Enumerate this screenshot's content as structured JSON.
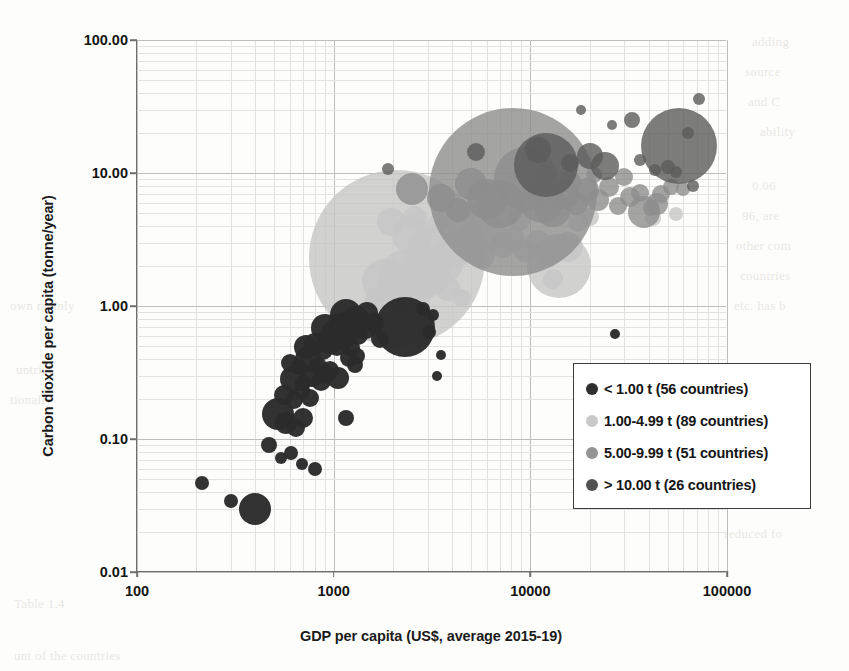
{
  "chart_data": {
    "type": "scatter",
    "title": "",
    "xlabel": "GDP per capita (US$, average 2015-19)",
    "ylabel": "Carbon dioxide per capita (tonne/year)",
    "xscale": "log",
    "yscale": "log",
    "xlim": [
      100,
      100000
    ],
    "ylim": [
      0.01,
      100.0
    ],
    "xticks": [
      "100",
      "1000",
      "10000",
      "100000"
    ],
    "xtick_values": [
      100,
      1000,
      10000,
      100000
    ],
    "yticks": [
      "100.00",
      "10.00",
      "1.00",
      "0.10",
      "0.01"
    ],
    "ytick_values": [
      100.0,
      10.0,
      1.0,
      0.1,
      0.01
    ],
    "grid": "major and minor log gridlines, light gray",
    "legend_position": "inside lower-right of plot area",
    "bubble_encoding": "bubble area ~ total national CO2 emissions; color = CO2 per-capita band",
    "series": [
      {
        "name": "< 1.00 t (56 countries)",
        "label": "< 1.00 t",
        "count": 56,
        "color": "#2b2b2b",
        "points": [
          {
            "x": 215,
            "y": 0.047,
            "r": 7
          },
          {
            "x": 300,
            "y": 0.034,
            "r": 7
          },
          {
            "x": 400,
            "y": 0.03,
            "r": 16
          },
          {
            "x": 470,
            "y": 0.09,
            "r": 8
          },
          {
            "x": 540,
            "y": 0.072,
            "r": 6
          },
          {
            "x": 610,
            "y": 0.078,
            "r": 7
          },
          {
            "x": 690,
            "y": 0.065,
            "r": 6
          },
          {
            "x": 800,
            "y": 0.06,
            "r": 7
          },
          {
            "x": 520,
            "y": 0.155,
            "r": 16
          },
          {
            "x": 575,
            "y": 0.132,
            "r": 11
          },
          {
            "x": 640,
            "y": 0.12,
            "r": 9
          },
          {
            "x": 700,
            "y": 0.145,
            "r": 10
          },
          {
            "x": 560,
            "y": 0.215,
            "r": 10
          },
          {
            "x": 630,
            "y": 0.195,
            "r": 9
          },
          {
            "x": 690,
            "y": 0.23,
            "r": 8
          },
          {
            "x": 760,
            "y": 0.205,
            "r": 9
          },
          {
            "x": 620,
            "y": 0.285,
            "r": 13
          },
          {
            "x": 700,
            "y": 0.265,
            "r": 8
          },
          {
            "x": 780,
            "y": 0.3,
            "r": 11
          },
          {
            "x": 860,
            "y": 0.275,
            "r": 10
          },
          {
            "x": 600,
            "y": 0.37,
            "r": 9
          },
          {
            "x": 670,
            "y": 0.345,
            "r": 8
          },
          {
            "x": 740,
            "y": 0.4,
            "r": 13
          },
          {
            "x": 830,
            "y": 0.355,
            "r": 9
          },
          {
            "x": 900,
            "y": 0.31,
            "r": 10
          },
          {
            "x": 960,
            "y": 0.33,
            "r": 9
          },
          {
            "x": 1050,
            "y": 0.29,
            "r": 11
          },
          {
            "x": 1150,
            "y": 0.145,
            "r": 8
          },
          {
            "x": 1200,
            "y": 0.41,
            "r": 9
          },
          {
            "x": 1280,
            "y": 0.36,
            "r": 8
          },
          {
            "x": 720,
            "y": 0.49,
            "r": 12
          },
          {
            "x": 800,
            "y": 0.52,
            "r": 11
          },
          {
            "x": 880,
            "y": 0.47,
            "r": 10
          },
          {
            "x": 960,
            "y": 0.545,
            "r": 13
          },
          {
            "x": 1040,
            "y": 0.5,
            "r": 10
          },
          {
            "x": 1130,
            "y": 0.56,
            "r": 11
          },
          {
            "x": 1230,
            "y": 0.48,
            "r": 9
          },
          {
            "x": 1320,
            "y": 0.42,
            "r": 8
          },
          {
            "x": 900,
            "y": 0.68,
            "r": 14
          },
          {
            "x": 1000,
            "y": 0.64,
            "r": 12
          },
          {
            "x": 1100,
            "y": 0.72,
            "r": 13
          },
          {
            "x": 1210,
            "y": 0.66,
            "r": 11
          },
          {
            "x": 1330,
            "y": 0.61,
            "r": 10
          },
          {
            "x": 1450,
            "y": 0.7,
            "r": 12
          },
          {
            "x": 1150,
            "y": 0.86,
            "r": 16
          },
          {
            "x": 1300,
            "y": 0.8,
            "r": 13
          },
          {
            "x": 1480,
            "y": 0.88,
            "r": 11
          },
          {
            "x": 1600,
            "y": 0.75,
            "r": 10
          },
          {
            "x": 1720,
            "y": 0.56,
            "r": 9
          },
          {
            "x": 2300,
            "y": 0.7,
            "r": 30
          },
          {
            "x": 2850,
            "y": 0.95,
            "r": 7
          },
          {
            "x": 3050,
            "y": 0.64,
            "r": 7
          },
          {
            "x": 3200,
            "y": 0.86,
            "r": 6
          },
          {
            "x": 3350,
            "y": 0.3,
            "r": 5
          },
          {
            "x": 3500,
            "y": 0.43,
            "r": 5
          },
          {
            "x": 27000,
            "y": 0.62,
            "r": 5
          }
        ]
      },
      {
        "name": "1.00-4.99 t (89 countries)",
        "label": "1.00-4.99 t",
        "count": 89,
        "color": "#c5c5c5",
        "points": [
          {
            "x": 2100,
            "y": 2.3,
            "r": 88
          },
          {
            "x": 2400,
            "y": 1.6,
            "r": 30
          },
          {
            "x": 1800,
            "y": 1.55,
            "r": 22
          },
          {
            "x": 2900,
            "y": 1.8,
            "r": 26
          },
          {
            "x": 2500,
            "y": 3.4,
            "r": 20
          },
          {
            "x": 3100,
            "y": 2.6,
            "r": 24
          },
          {
            "x": 3600,
            "y": 2.1,
            "r": 20
          },
          {
            "x": 4200,
            "y": 2.7,
            "r": 18
          },
          {
            "x": 4900,
            "y": 3.1,
            "r": 16
          },
          {
            "x": 5600,
            "y": 2.4,
            "r": 14
          },
          {
            "x": 6400,
            "y": 3.5,
            "r": 15
          },
          {
            "x": 7300,
            "y": 2.9,
            "r": 13
          },
          {
            "x": 8200,
            "y": 3.2,
            "r": 12
          },
          {
            "x": 9400,
            "y": 2.6,
            "r": 11
          },
          {
            "x": 11000,
            "y": 3.0,
            "r": 13
          },
          {
            "x": 12500,
            "y": 2.4,
            "r": 12
          },
          {
            "x": 14000,
            "y": 2.0,
            "r": 32
          },
          {
            "x": 15500,
            "y": 2.8,
            "r": 15
          },
          {
            "x": 17500,
            "y": 4.3,
            "r": 10
          },
          {
            "x": 20000,
            "y": 4.7,
            "r": 9
          },
          {
            "x": 1950,
            "y": 4.3,
            "r": 14
          },
          {
            "x": 2600,
            "y": 4.6,
            "r": 12
          },
          {
            "x": 3400,
            "y": 4.2,
            "r": 10
          },
          {
            "x": 5200,
            "y": 4.8,
            "r": 12
          },
          {
            "x": 8800,
            "y": 4.4,
            "r": 11
          },
          {
            "x": 1700,
            "y": 1.1,
            "r": 14
          },
          {
            "x": 2200,
            "y": 1.2,
            "r": 12
          },
          {
            "x": 3800,
            "y": 1.35,
            "r": 12
          },
          {
            "x": 4500,
            "y": 1.15,
            "r": 9
          },
          {
            "x": 13000,
            "y": 1.6,
            "r": 10
          },
          {
            "x": 42000,
            "y": 4.6,
            "r": 8
          },
          {
            "x": 55000,
            "y": 4.9,
            "r": 7
          }
        ]
      },
      {
        "name": "5.00-9.99 t (51 countries)",
        "label": "5.00-9.99 t",
        "count": 51,
        "color": "#8d8d8d",
        "points": [
          {
            "x": 8200,
            "y": 7.2,
            "r": 84
          },
          {
            "x": 9500,
            "y": 9.0,
            "r": 32
          },
          {
            "x": 7000,
            "y": 5.8,
            "r": 24
          },
          {
            "x": 6000,
            "y": 6.4,
            "r": 20
          },
          {
            "x": 5000,
            "y": 8.2,
            "r": 16
          },
          {
            "x": 2500,
            "y": 7.6,
            "r": 16
          },
          {
            "x": 3500,
            "y": 6.5,
            "r": 14
          },
          {
            "x": 4300,
            "y": 5.3,
            "r": 12
          },
          {
            "x": 11500,
            "y": 6.2,
            "r": 22
          },
          {
            "x": 13000,
            "y": 5.4,
            "r": 18
          },
          {
            "x": 15000,
            "y": 6.8,
            "r": 14
          },
          {
            "x": 17000,
            "y": 5.9,
            "r": 12
          },
          {
            "x": 19500,
            "y": 7.4,
            "r": 12
          },
          {
            "x": 22000,
            "y": 6.3,
            "r": 11
          },
          {
            "x": 25000,
            "y": 7.8,
            "r": 10
          },
          {
            "x": 28000,
            "y": 5.6,
            "r": 9
          },
          {
            "x": 32000,
            "y": 6.6,
            "r": 10
          },
          {
            "x": 36000,
            "y": 7.1,
            "r": 9
          },
          {
            "x": 41000,
            "y": 5.5,
            "r": 8
          },
          {
            "x": 46000,
            "y": 6.9,
            "r": 9
          },
          {
            "x": 52000,
            "y": 7.8,
            "r": 8
          },
          {
            "x": 60000,
            "y": 7.6,
            "r": 7
          },
          {
            "x": 38000,
            "y": 5.1,
            "r": 16
          },
          {
            "x": 44000,
            "y": 5.8,
            "r": 11
          },
          {
            "x": 30000,
            "y": 9.3,
            "r": 9
          },
          {
            "x": 21000,
            "y": 9.6,
            "r": 8
          },
          {
            "x": 16000,
            "y": 8.6,
            "r": 11
          },
          {
            "x": 12000,
            "y": 9.8,
            "r": 10
          }
        ]
      },
      {
        "name": "> 10.00 t (26 countries)",
        "label": "> 10.00 t",
        "count": 26,
        "color": "#5b5b5b",
        "points": [
          {
            "x": 57000,
            "y": 16.0,
            "r": 38
          },
          {
            "x": 12000,
            "y": 11.5,
            "r": 32
          },
          {
            "x": 11000,
            "y": 15.0,
            "r": 13
          },
          {
            "x": 20000,
            "y": 13.5,
            "r": 13
          },
          {
            "x": 24000,
            "y": 11.2,
            "r": 14
          },
          {
            "x": 5300,
            "y": 14.5,
            "r": 9
          },
          {
            "x": 16000,
            "y": 11.8,
            "r": 9
          },
          {
            "x": 33000,
            "y": 25.0,
            "r": 8
          },
          {
            "x": 72000,
            "y": 36.0,
            "r": 6
          },
          {
            "x": 26000,
            "y": 23.0,
            "r": 5
          },
          {
            "x": 63000,
            "y": 20.0,
            "r": 6
          },
          {
            "x": 18000,
            "y": 30.0,
            "r": 5
          },
          {
            "x": 50000,
            "y": 11.0,
            "r": 7
          },
          {
            "x": 43000,
            "y": 10.5,
            "r": 6
          },
          {
            "x": 36000,
            "y": 12.5,
            "r": 6
          },
          {
            "x": 1900,
            "y": 10.8,
            "r": 6
          },
          {
            "x": 55000,
            "y": 10.2,
            "r": 6
          },
          {
            "x": 67000,
            "y": 8.0,
            "r": 6
          }
        ]
      }
    ]
  },
  "legend": {
    "entries": [
      {
        "label": "< 1.00 t (56 countries)",
        "color": "#2f2f2f"
      },
      {
        "label": "1.00-4.99 t (89 countries)",
        "color": "#c9c9c9"
      },
      {
        "label": "5.00-9.99 t (51 countries)",
        "color": "#949494"
      },
      {
        "label": "> 10.00 t (26 countries)",
        "color": "#525252"
      }
    ]
  },
  "background_bleed": [
    "adding",
    "source",
    "and C",
    "ability",
    "0.06",
    "96, are",
    "other com",
    "countries",
    "etc. has b",
    "own mainly",
    "untries",
    "tionally",
    "m, comp",
    "lata on",
    "e is an",
    "1. See also",
    "reduced fo",
    "Table 1.4",
    "unt of the countries"
  ]
}
